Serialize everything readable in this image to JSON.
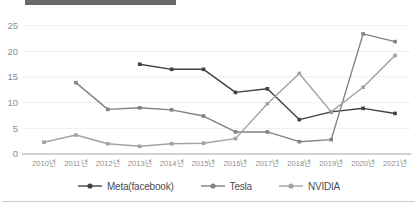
{
  "decor": {
    "top_bar_color": "#666a6d",
    "bottom_rule_color": "#c9cccf"
  },
  "chart_data": {
    "type": "line",
    "title": "",
    "subtitle": "",
    "xlabel": "",
    "ylabel": "",
    "categories": [
      "2010년",
      "2011년",
      "2012년",
      "2013년",
      "2014년",
      "2015년",
      "2016년",
      "2017년",
      "2018년",
      "2019년",
      "2020년",
      "2021년"
    ],
    "yticks": [
      0,
      5,
      10,
      15,
      20,
      25
    ],
    "ylim": [
      0,
      26.5
    ],
    "grid": true,
    "grid_axis": "y",
    "legend_position": "bottom",
    "series": [
      {
        "name": "Meta(facebook)",
        "color": "#3f4143",
        "values": [
          null,
          null,
          null,
          17.5,
          16.5,
          16.5,
          12.0,
          12.7,
          6.7,
          8.2,
          8.9,
          7.9
        ]
      },
      {
        "name": "Tesla",
        "color": "#7f8386",
        "values": [
          null,
          13.9,
          8.7,
          9.0,
          8.6,
          7.4,
          4.3,
          4.3,
          2.4,
          2.8,
          23.4,
          21.9
        ]
      },
      {
        "name": "NVIDIA",
        "color": "#9fa3a6",
        "values": [
          2.3,
          3.7,
          2.0,
          1.5,
          2.0,
          2.1,
          3.0,
          9.8,
          15.7,
          8.2,
          13.0,
          19.2
        ]
      }
    ]
  },
  "axis": {
    "tick_color": "#8a8d90",
    "axis_line_color": "#9fa3a6",
    "grid_color": "#efefef"
  }
}
